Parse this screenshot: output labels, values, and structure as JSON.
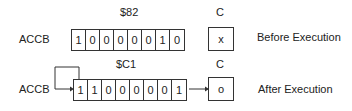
{
  "diagram": {
    "before": {
      "register_label": "ACCB",
      "hex_value": "$82",
      "bits": [
        "1",
        "0",
        "0",
        "0",
        "0",
        "0",
        "1",
        "0"
      ],
      "carry_label": "C",
      "carry_value": "x",
      "caption": "Before Execution"
    },
    "after": {
      "register_label": "ACCB",
      "hex_value": "$C1",
      "bits": [
        "1",
        "1",
        "0",
        "0",
        "0",
        "0",
        "0",
        "1"
      ],
      "carry_label": "C",
      "carry_value": "o",
      "caption": "After Execution"
    }
  }
}
